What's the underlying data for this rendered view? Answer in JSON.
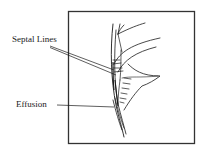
{
  "figure": {
    "labels": {
      "septal_lines": "Septal Lines",
      "effusion": "Effusion"
    },
    "colors": {
      "ink": "#1a1a1a",
      "frame": "#333333",
      "background": "#ffffff"
    }
  }
}
